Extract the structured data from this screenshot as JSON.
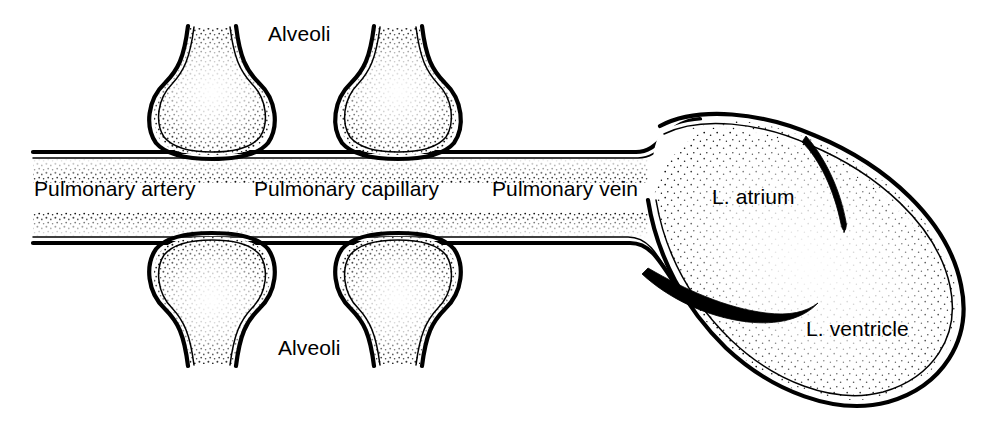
{
  "figure": {
    "width": 985,
    "height": 427,
    "background_color": "#ffffff",
    "ink_color": "#000000",
    "style": "black-and-white stippled line art"
  },
  "labels": {
    "alveoli_top": "Alveoli",
    "alveoli_bottom": "Alveoli",
    "pulmonary_artery": "Pulmonary artery",
    "pulmonary_capillary": "Pulmonary capillary",
    "pulmonary_vein": "Pulmonary vein",
    "left_atrium": "L. atrium",
    "left_ventricle": "L. ventricle"
  },
  "structures": {
    "alveoli_count": 4,
    "alveoli_top_count": 2,
    "alveoli_bottom_count": 2,
    "vessel_segments": [
      "Pulmonary artery",
      "Pulmonary capillary",
      "Pulmonary vein"
    ],
    "heart_chambers": [
      "L. atrium",
      "L. ventricle"
    ],
    "valve_leaflets": 2
  }
}
